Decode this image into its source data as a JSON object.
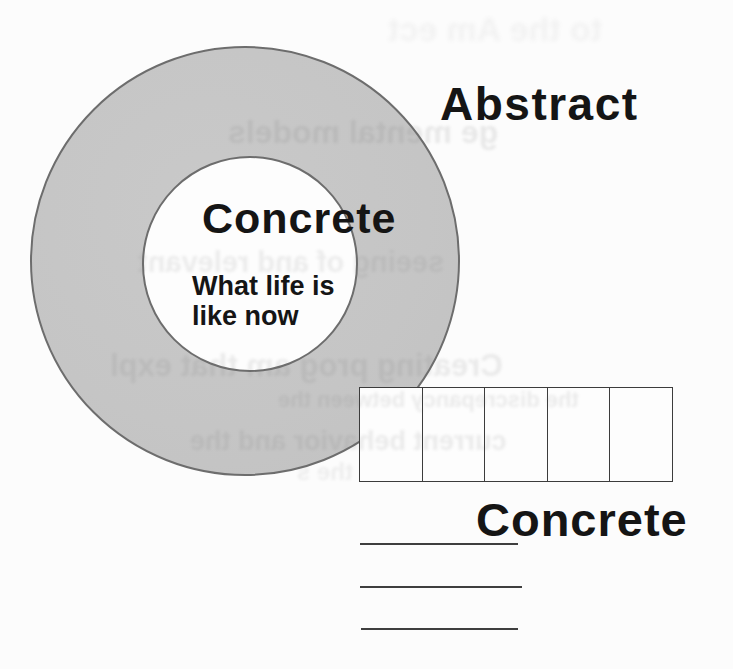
{
  "diagram": {
    "abstract_label": "Abstract",
    "inner_circle": {
      "label": "Concrete",
      "caption_line1": "What life is",
      "caption_line2": "like now"
    },
    "bottom_label": "Concrete",
    "strip_cell_count": 5,
    "blank_line_count": 3
  },
  "ghost_text": {
    "lines": [
      {
        "text": "to the Am ect"
      },
      {
        "text": "ge mental models"
      },
      {
        "text": "seeing of and relevant"
      },
      {
        "text": "Creating prog am that expl"
      },
      {
        "text": "the discrepancy between the"
      },
      {
        "text": "current behavior and the"
      },
      {
        "text": "the s"
      }
    ]
  },
  "colors": {
    "page_background": "#fcfcfc",
    "ring_fill": "#c6c6c6",
    "circle_outline": "#6d6d6d",
    "label_text": "#151515",
    "strip_border": "#3c3c3c",
    "blank_line": "#3f3f3f",
    "ghost_text": "#6f6f6f"
  }
}
